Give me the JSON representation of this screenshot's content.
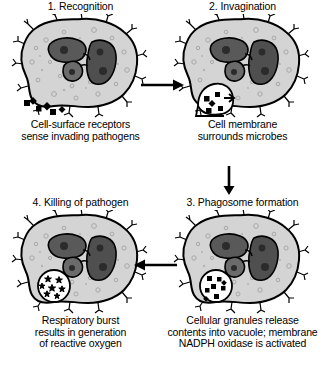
{
  "figure": {
    "colors": {
      "cell_cytoplasm": "#d4d4d4",
      "cell_outline": "#000000",
      "nucleus": "#595959",
      "nucleolus": "#2b2b2b",
      "pathogen": "#000000",
      "vacuole": "#ffffff",
      "granule": "#bdbdbd",
      "background": "#ffffff"
    }
  },
  "panels": [
    {
      "id": "recognition",
      "title": "1. Recognition",
      "caption": [
        "Cell-surface receptors",
        "sense invading pathogens"
      ],
      "cell_name": "phagocyte-cell-recognition",
      "features": [
        "cell-surface-receptors",
        "lobed-nucleus",
        "cytoplasmic-granules",
        "extracellular-pathogens"
      ]
    },
    {
      "id": "invagination",
      "title": "2. Invagination",
      "caption": [
        "Cell membrane",
        "surrounds microbes"
      ],
      "cell_name": "phagocyte-cell-invagination",
      "features": [
        "cell-surface-receptors",
        "lobed-nucleus",
        "membrane-invagination-pocket",
        "engulfed-pathogens"
      ]
    },
    {
      "id": "phagosome-formation",
      "title": "3. Phagosome formation",
      "caption": [
        "Cellular granules release",
        "contents into vacuole; membrane",
        "NADPH oxidase is activated"
      ],
      "cell_name": "phagocyte-cell-phagosome",
      "features": [
        "cell-surface-receptors",
        "lobed-nucleus",
        "phagosome-vacuole",
        "pathogen-fragments"
      ]
    },
    {
      "id": "killing-of-pathogen",
      "title": "4. Killing of pathogen",
      "caption": [
        "Respiratory burst",
        "results in generation",
        "of reactive oxygen"
      ],
      "cell_name": "phagocyte-cell-killing",
      "features": [
        "cell-surface-receptors",
        "lobed-nucleus",
        "phagosome-vacuole",
        "reactive-oxygen-species"
      ]
    }
  ],
  "arrows": [
    {
      "id": "arrow-1-to-2",
      "direction": "right",
      "label": "from recognition to invagination"
    },
    {
      "id": "arrow-2-to-3",
      "direction": "down",
      "label": "from invagination to phagosome formation"
    },
    {
      "id": "arrow-3-to-4",
      "direction": "left",
      "label": "from phagosome formation to killing of pathogen"
    }
  ]
}
